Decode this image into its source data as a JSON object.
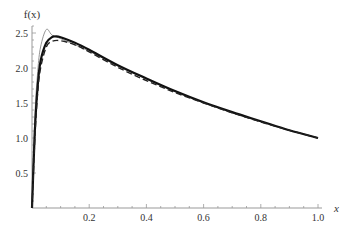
{
  "chart_data": {
    "type": "line",
    "title": "",
    "xlabel": "x",
    "ylabel": "f(x)",
    "xlim": [
      0,
      1.0
    ],
    "ylim": [
      0,
      2.6
    ],
    "grid": false,
    "legend": null,
    "x_ticks": [
      "0.2",
      "0.4",
      "0.6",
      "0.8",
      "1.0"
    ],
    "y_ticks": [
      "0.5",
      "1.0",
      "1.5",
      "2.0",
      "2.5"
    ],
    "series": [
      {
        "name": "thin-gray",
        "style": "thin solid gray",
        "x": [
          0,
          0.01,
          0.02,
          0.03,
          0.05,
          0.07,
          0.1,
          0.2,
          0.3,
          0.4,
          0.5,
          0.6,
          0.7,
          0.8,
          0.9,
          1.0
        ],
        "y": [
          0,
          1.3,
          1.95,
          2.3,
          2.55,
          2.47,
          2.42,
          2.24,
          2.03,
          1.84,
          1.66,
          1.5,
          1.36,
          1.23,
          1.11,
          1.0
        ]
      },
      {
        "name": "thick-solid",
        "style": "thick solid black",
        "x": [
          0,
          0.01,
          0.02,
          0.03,
          0.05,
          0.07,
          0.08,
          0.1,
          0.15,
          0.2,
          0.3,
          0.4,
          0.5,
          0.6,
          0.7,
          0.8,
          0.9,
          1.0
        ],
        "y": [
          0,
          1.1,
          1.75,
          2.1,
          2.36,
          2.44,
          2.45,
          2.44,
          2.36,
          2.26,
          2.04,
          1.85,
          1.67,
          1.51,
          1.37,
          1.24,
          1.11,
          1.0
        ],
        "color": "#111111"
      },
      {
        "name": "dashed",
        "style": "dashed black",
        "x": [
          0,
          0.01,
          0.02,
          0.03,
          0.05,
          0.07,
          0.1,
          0.15,
          0.2,
          0.3,
          0.4,
          0.5,
          0.6,
          0.7,
          0.8,
          0.9,
          1.0
        ],
        "y": [
          0,
          1.0,
          1.65,
          2.0,
          2.3,
          2.38,
          2.39,
          2.33,
          2.23,
          2.01,
          1.82,
          1.65,
          1.5,
          1.36,
          1.23,
          1.11,
          1.0
        ],
        "color": "#222222"
      }
    ]
  }
}
